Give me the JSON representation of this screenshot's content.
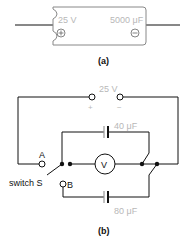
{
  "figure_a": {
    "caption": "(a)",
    "voltage_label": "25 V",
    "capacitance_label": "5000 μF",
    "positive_symbol": "+",
    "negative_symbol": "−"
  },
  "figure_b": {
    "caption": "(b)",
    "source_label": "25 V",
    "source_plus": "+",
    "source_minus": "−",
    "capacitor_top_label": "40 μF",
    "capacitor_bottom_label": "80 μF",
    "voltmeter_label": "V",
    "terminal_a_label": "A",
    "terminal_b_label": "B",
    "switch_label": "switch S"
  },
  "colors": {
    "line": "#111111",
    "label_gray": "#b8b8b8"
  }
}
